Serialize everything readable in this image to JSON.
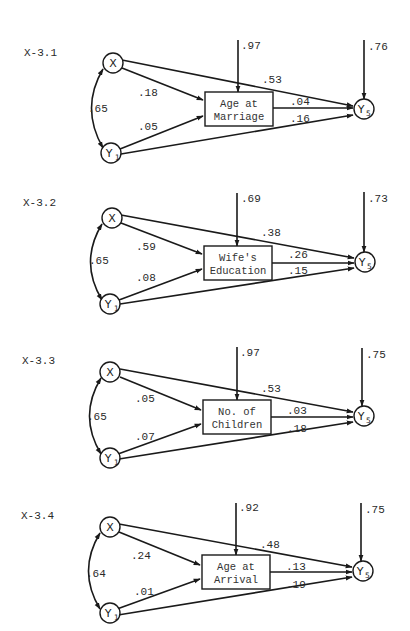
{
  "diagrams": [
    {
      "id": "X-3.1",
      "label": "X-3.1",
      "mediator": [
        "Age at",
        "Marriage"
      ],
      "residual_mediator": ".97",
      "residual_y5": ".76",
      "corr_x_y1": ".65",
      "x_to_m": ".18",
      "y1_to_m": ".05",
      "x_to_y5": ".53",
      "m_to_y5": ".04",
      "y1_to_y5": ".16"
    },
    {
      "id": "X-3.2",
      "label": "X-3.2",
      "mediator": [
        "Wife's",
        "Education"
      ],
      "residual_mediator": ".69",
      "residual_y5": ".73",
      "corr_x_y1": ".65",
      "x_to_m": ".59",
      "y1_to_m": ".08",
      "x_to_y5": ".38",
      "m_to_y5": ".26",
      "y1_to_y5": ".15"
    },
    {
      "id": "X-3.3",
      "label": "X-3.3",
      "mediator": [
        "No. of",
        "Children"
      ],
      "residual_mediator": ".97",
      "residual_y5": ".75",
      "corr_x_y1": ".65",
      "x_to_m": ".05",
      "y1_to_m": ".07",
      "x_to_y5": ".53",
      "m_to_y5": ".03",
      "y1_to_y5": ".18"
    },
    {
      "id": "X-3.4",
      "label": "X-3.4",
      "mediator": [
        "Age at",
        "Arrival"
      ],
      "residual_mediator": ".92",
      "residual_y5": ".75",
      "corr_x_y1": ".64",
      "x_to_m": ".24",
      "y1_to_m": ".01",
      "x_to_y5": ".48",
      "m_to_y5": ".13",
      "y1_to_y5": ".19"
    }
  ],
  "nodes": {
    "x": "X",
    "y1_main": "Y",
    "y1_sub": "1",
    "y5_main": "Y",
    "y5_sub": "5"
  }
}
